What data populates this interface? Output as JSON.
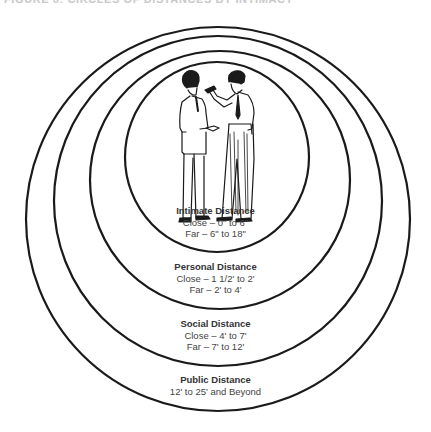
{
  "caption": "FIGURE 6: CIRCLES OF DISTANCES BY INTIMACY",
  "colors": {
    "ring": "#1a1a1a",
    "background": "#ffffff",
    "text": "#333333"
  },
  "illustration": "two-men-talking",
  "zones": [
    {
      "title": "Intimate Distance",
      "lines": [
        "Close – 0\" to 6\"",
        "Far – 6\" to 18\""
      ]
    },
    {
      "title": "Personal Distance",
      "lines": [
        "Close – 1 1/2' to 2'",
        "Far – 2' to 4'"
      ]
    },
    {
      "title": "Social Distance",
      "lines": [
        "Close – 4' to 7'",
        "Far – 7' to 12'"
      ]
    },
    {
      "title": "Public Distance",
      "lines": [
        "12' to 25' and Beyond"
      ]
    }
  ]
}
